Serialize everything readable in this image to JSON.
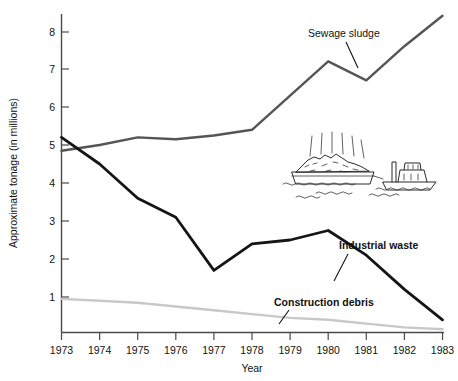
{
  "chart_data": {
    "type": "line",
    "title": "",
    "subtitle": "",
    "xlabel": "Year",
    "ylabel": "Approximate tonage (in millions)",
    "x": [
      1973,
      1974,
      1975,
      1976,
      1977,
      1978,
      1979,
      1980,
      1981,
      1982,
      1983
    ],
    "xlim": [
      1973,
      1983
    ],
    "ylim": [
      0,
      8.6
    ],
    "yticks": [
      1,
      2,
      3,
      4,
      5,
      6,
      7,
      8
    ],
    "ytick_labels": [
      "1",
      "2",
      "3",
      "4",
      "5",
      "6",
      "7",
      "8"
    ],
    "xtick_labels": [
      "1973",
      "1974",
      "1975",
      "1976",
      "1977",
      "1978",
      "1979",
      "1980",
      "1981",
      "1982",
      "1983"
    ],
    "grid": false,
    "legend": "inline-annotations",
    "series": [
      {
        "name": "Sewage sludge",
        "color": "#555555",
        "values": [
          4.85,
          5.0,
          5.2,
          5.15,
          5.25,
          5.4,
          6.3,
          7.2,
          6.7,
          7.6,
          8.4
        ],
        "label_position": "upper-right"
      },
      {
        "name": "Industrial waste",
        "color": "#151515",
        "values": [
          5.2,
          4.5,
          3.6,
          3.1,
          1.7,
          2.4,
          2.5,
          2.75,
          2.1,
          1.2,
          0.4
        ],
        "label_position": "middle-right"
      },
      {
        "name": "Construction debris",
        "color": "#c8c8c8",
        "values": [
          0.95,
          0.9,
          0.85,
          0.75,
          0.65,
          0.55,
          0.45,
          0.4,
          0.3,
          0.2,
          0.15
        ],
        "label_position": "lower-right"
      }
    ],
    "annotations": [
      {
        "text": "Sewage sludge",
        "bold": false
      },
      {
        "text": "Industrial waste",
        "bold": true
      },
      {
        "text": "Construction debris",
        "bold": true
      }
    ],
    "illustration": {
      "name": "garbage-barge-towed-by-tugboat",
      "description": "Line drawing of a refuse barge with heaped garbage and rising odor lines, towed by a tugboat on wavy water"
    }
  }
}
